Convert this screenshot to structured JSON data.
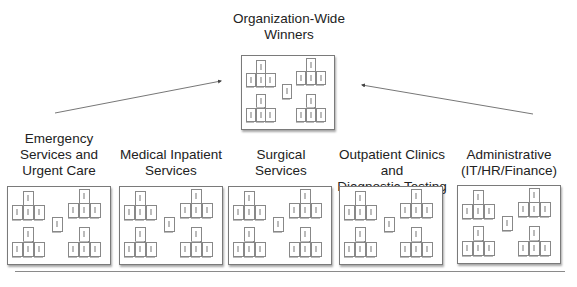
{
  "top": {
    "title": "Organization-Wide\nWinners"
  },
  "divisions": [
    {
      "title": "Emergency\nServices and\nUrgent Care"
    },
    {
      "title": "Medical Inpatient\nServices"
    },
    {
      "title": "Surgical\nServices"
    },
    {
      "title": "Outpatient Clinics and\nDiagnostic Testing"
    },
    {
      "title": "Administrative\n(IT/HR/Finance)"
    }
  ],
  "board_layout_note": "Each board shows four groups (1 leader card above 3 member cards) plus one central card; card labels are illegible at this resolution"
}
